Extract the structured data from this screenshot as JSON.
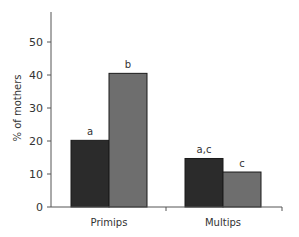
{
  "chart_data": {
    "type": "bar",
    "title": "",
    "xlabel": "",
    "ylabel": "% of mothers",
    "ylim": [
      0,
      55
    ],
    "yticks": [
      0,
      10,
      20,
      30,
      40,
      50
    ],
    "categories": [
      "Primips",
      "Multips"
    ],
    "series": [
      {
        "name": "Series 1",
        "color": "#2b2b2b",
        "values": [
          20.2,
          14.7
        ],
        "labels": [
          "a",
          "a,c"
        ]
      },
      {
        "name": "Series 2",
        "color": "#6e6e6e",
        "values": [
          40.5,
          10.6
        ],
        "labels": [
          "b",
          "c"
        ]
      }
    ],
    "grid": false,
    "legend": "none"
  }
}
